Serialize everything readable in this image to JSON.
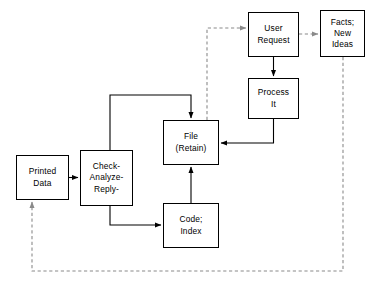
{
  "diagram": {
    "type": "flowchart",
    "background_color": "#ffffff",
    "stroke_color": "#000000",
    "solid_style": "solid",
    "dashed_style": "dashed",
    "nodes": [
      {
        "id": "printed-data",
        "name": "printed-data-box",
        "lines": [
          "Printed",
          "Data"
        ],
        "x": 16,
        "y": 155,
        "w": 53,
        "h": 45
      },
      {
        "id": "check-analyze-reply",
        "name": "check-analyze-reply-box",
        "lines": [
          "Check-",
          "Analyze-",
          "Reply-"
        ],
        "x": 80,
        "y": 150,
        "w": 53,
        "h": 56
      },
      {
        "id": "file-retain",
        "name": "file-retain-box",
        "lines": [
          "File",
          "(Retain)"
        ],
        "x": 163,
        "y": 120,
        "w": 56,
        "h": 45
      },
      {
        "id": "code-index",
        "name": "code-index-box",
        "lines": [
          "Code;",
          "Index"
        ],
        "x": 163,
        "y": 203,
        "w": 56,
        "h": 45
      },
      {
        "id": "user-request",
        "name": "user-request-box",
        "lines": [
          "User",
          "Request"
        ],
        "x": 248,
        "y": 12,
        "w": 51,
        "h": 45
      },
      {
        "id": "process-it",
        "name": "process-it-box",
        "lines": [
          "Process",
          "It"
        ],
        "x": 248,
        "y": 78,
        "w": 51,
        "h": 41
      },
      {
        "id": "facts-new-ideas",
        "name": "facts-new-ideas-box",
        "lines": [
          "Facts;",
          "New",
          "Ideas"
        ],
        "x": 320,
        "y": 10,
        "w": 45,
        "h": 47
      }
    ],
    "edges": [
      {
        "id": "printed-to-check",
        "from": "printed-data",
        "to": "check-analyze-reply",
        "style": "solid",
        "arrow": true
      },
      {
        "id": "check-to-file",
        "from": "check-analyze-reply",
        "to": "file-retain",
        "style": "solid",
        "arrow": true
      },
      {
        "id": "check-to-code",
        "from": "check-analyze-reply",
        "to": "code-index",
        "style": "solid",
        "arrow": true
      },
      {
        "id": "code-to-file",
        "from": "code-index",
        "to": "file-retain",
        "style": "solid",
        "arrow": true
      },
      {
        "id": "user-request-to-process",
        "from": "user-request",
        "to": "process-it",
        "style": "solid",
        "arrow": true
      },
      {
        "id": "process-to-file",
        "from": "process-it",
        "to": "file-retain",
        "style": "solid",
        "arrow": true
      },
      {
        "id": "file-to-user-request",
        "from": "file-retain",
        "to": "user-request",
        "style": "dashed",
        "arrow": true
      },
      {
        "id": "user-request-to-facts",
        "from": "user-request",
        "to": "facts-new-ideas",
        "style": "dashed",
        "arrow": true
      },
      {
        "id": "facts-to-printed-data",
        "from": "facts-new-ideas",
        "to": "printed-data",
        "style": "dashed",
        "arrow": true
      }
    ]
  }
}
